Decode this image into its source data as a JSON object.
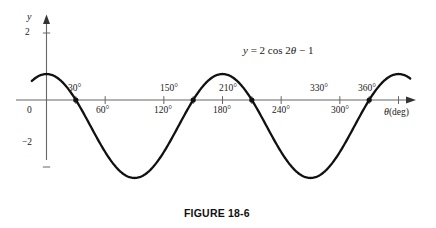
{
  "figure": {
    "caption": "FIGURE 18-6",
    "equation_text": "y = 2 cos 2θ − 1",
    "equation_parts": {
      "y": "y",
      "eq": "= 2 cos 2",
      "theta": "θ",
      "tail": "− 1"
    },
    "background_color": "#ffffff",
    "curve_color": "#111111",
    "axis_color": "#555555"
  },
  "axes": {
    "y_axis_label": "y",
    "x_axis_label": "θ",
    "x_axis_unit": "(deg)",
    "origin_label": "0",
    "y_ticks": [
      {
        "label": "2",
        "value": 2
      },
      {
        "label": "−2",
        "value": -2
      }
    ],
    "x_ticks_below": [
      {
        "label": "60°",
        "value": 60
      },
      {
        "label": "120°",
        "value": 120
      },
      {
        "label": "180°",
        "value": 180
      },
      {
        "label": "240°",
        "value": 240
      },
      {
        "label": "300°",
        "value": 300
      }
    ],
    "x_ticks_above": [
      {
        "label": "30°",
        "value": 30
      },
      {
        "label": "150°",
        "value": 150
      },
      {
        "label": "210°",
        "value": 210
      },
      {
        "label": "330°",
        "value": 330
      },
      {
        "label": "360°",
        "value": 360
      }
    ]
  },
  "chart_data": {
    "type": "line",
    "title": "FIGURE 18-6",
    "subtitle": "",
    "xlabel": "θ (deg)",
    "ylabel": "y",
    "xlim": [
      -15,
      375
    ],
    "ylim": [
      -3.2,
      2.4
    ],
    "grid": false,
    "legend": "none",
    "annotations": [
      {
        "text": "y = 2 cos 2θ − 1",
        "x": 180,
        "y": 1.9
      }
    ],
    "equation": "y = 2*cos(2*theta) - 1",
    "amplitude": 2,
    "period_deg": 180,
    "vertical_shift": -1,
    "series": [
      {
        "name": "y = 2 cos 2θ − 1",
        "x": [
          -15,
          0,
          15,
          30,
          45,
          60,
          75,
          90,
          105,
          120,
          135,
          150,
          165,
          180,
          195,
          210,
          225,
          240,
          255,
          270,
          285,
          300,
          315,
          330,
          345,
          360,
          372
        ],
        "y": [
          0.73,
          1.0,
          0.73,
          0.0,
          -1.0,
          -2.0,
          -2.73,
          -3.0,
          -2.73,
          -2.0,
          -1.0,
          0.0,
          0.73,
          1.0,
          0.73,
          0.0,
          -1.0,
          -2.0,
          -2.73,
          -3.0,
          -2.73,
          -2.0,
          -1.0,
          0.0,
          0.73,
          1.0,
          0.83
        ]
      }
    ],
    "zero_crossings_deg": [
      30,
      150,
      210,
      330
    ],
    "maxima": [
      {
        "x": 0,
        "y": 1
      },
      {
        "x": 180,
        "y": 1
      },
      {
        "x": 360,
        "y": 1
      }
    ],
    "minima": [
      {
        "x": 90,
        "y": -3
      },
      {
        "x": 270,
        "y": -3
      }
    ]
  }
}
